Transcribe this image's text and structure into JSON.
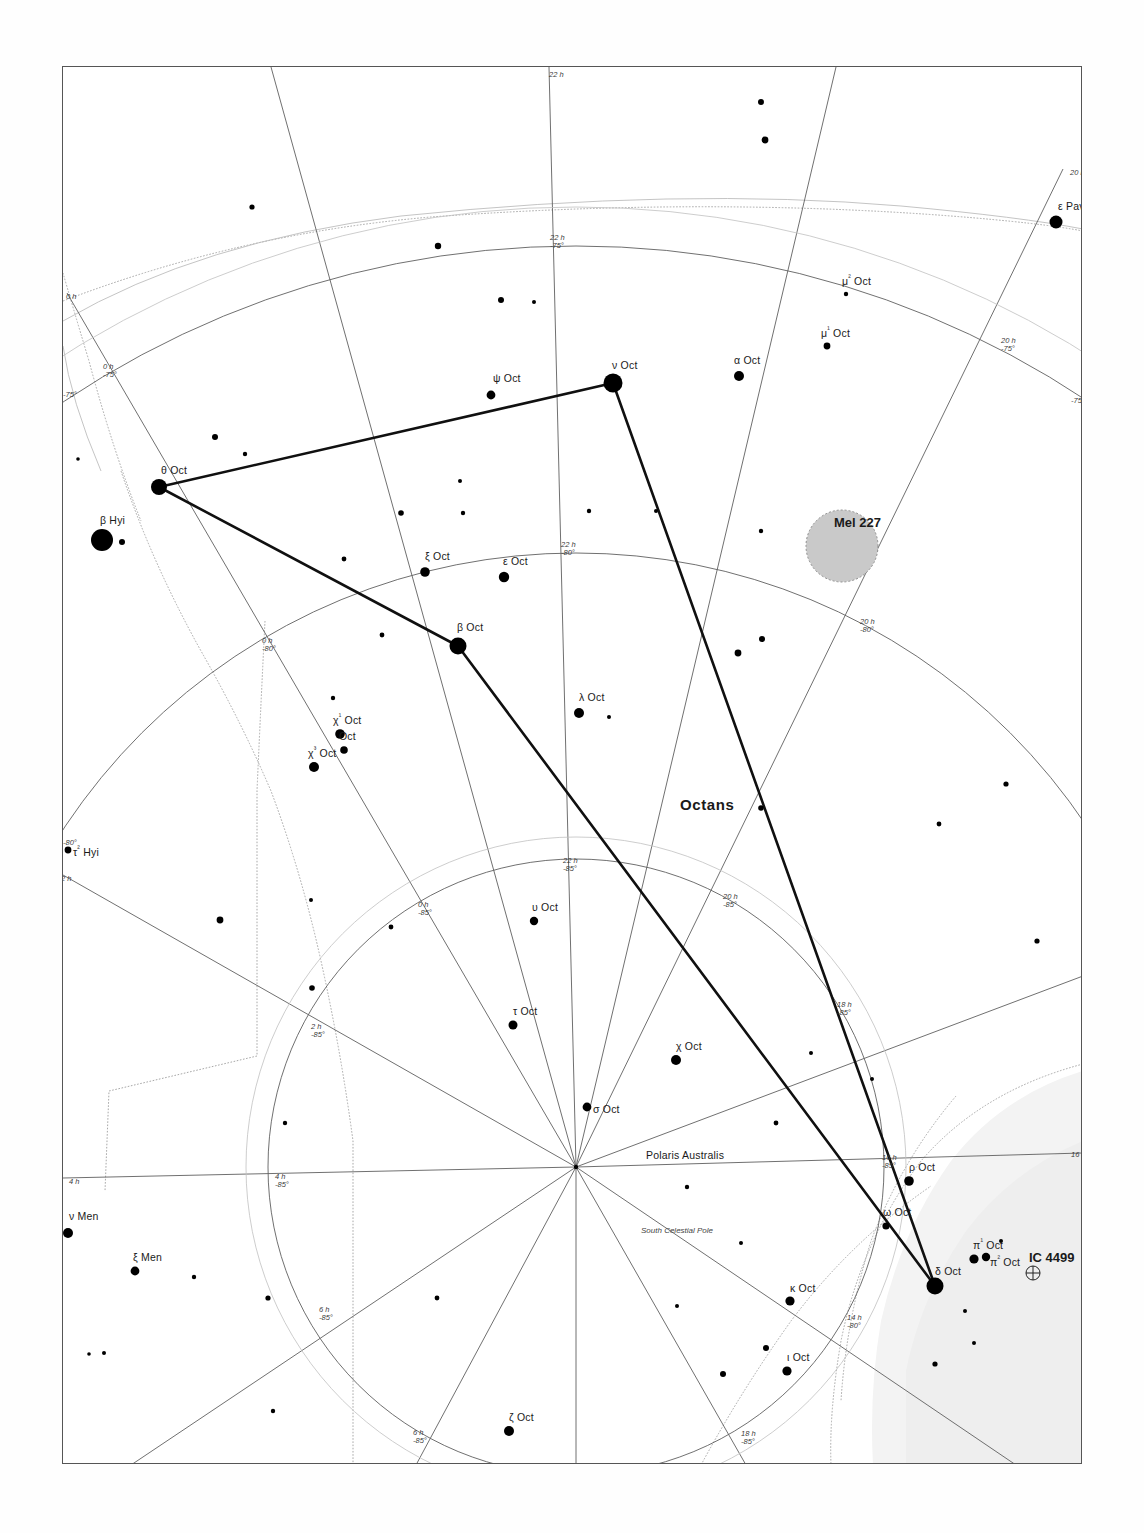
{
  "chart_title": "Octans star chart",
  "constellation": {
    "name": "Octans",
    "x": 617,
    "y": 737
  },
  "pole": {
    "label": "South Celestial Pole",
    "x": 575,
    "y": 1166
  },
  "stars": [
    {
      "name": "ε Pav",
      "label": "ε Pav",
      "x": 1055,
      "y": 221,
      "mag": 4.0,
      "r": 6.5,
      "lx": 1057,
      "ly": 199
    },
    {
      "name": "μ² Oct",
      "label": "μ² Oct",
      "x": 845,
      "y": 293,
      "mag": 6.5,
      "r": 2.2,
      "lx": 841,
      "ly": 272
    },
    {
      "name": "μ¹ Oct",
      "label": "μ¹ Oct",
      "x": 826,
      "y": 345,
      "mag": 6.0,
      "r": 3.4,
      "lx": 820,
      "ly": 324
    },
    {
      "name": "α Oct",
      "label": "α Oct",
      "x": 738,
      "y": 375,
      "mag": 5.1,
      "r": 5.0,
      "lx": 733,
      "ly": 353
    },
    {
      "name": "ν Oct",
      "label": "ν Oct",
      "x": 612,
      "y": 382,
      "mag": 3.7,
      "r": 9.5,
      "lx": 611,
      "ly": 358
    },
    {
      "name": "ψ Oct",
      "label": "ψ Oct",
      "x": 490,
      "y": 394,
      "mag": 5.5,
      "r": 4.4,
      "lx": 492,
      "ly": 371
    },
    {
      "name": "θ Oct",
      "label": "θ Oct",
      "x": 158,
      "y": 486,
      "mag": 4.7,
      "r": 8.0,
      "lx": 160,
      "ly": 463
    },
    {
      "name": "β Hyi",
      "label": "β Hyi",
      "x": 101,
      "y": 539,
      "mag": 2.8,
      "r": 11.0,
      "lx": 99,
      "ly": 513
    },
    {
      "name": "HIP-b",
      "label": "",
      "x": 121,
      "y": 541,
      "mag": 6.2,
      "r": 3.0,
      "lx": 0,
      "ly": 0
    },
    {
      "name": "ξ Oct",
      "label": "ξ Oct",
      "x": 424,
      "y": 571,
      "mag": 5.3,
      "r": 4.8,
      "lx": 424,
      "ly": 549
    },
    {
      "name": "ε Oct",
      "label": "ε Oct",
      "x": 503,
      "y": 576,
      "mag": 5.1,
      "r": 5.2,
      "lx": 502,
      "ly": 554
    },
    {
      "name": "β Oct",
      "label": "β Oct",
      "x": 457,
      "y": 645,
      "mag": 4.1,
      "r": 8.5,
      "lx": 456,
      "ly": 620
    },
    {
      "name": "λ Oct",
      "label": "λ Oct",
      "x": 578,
      "y": 712,
      "mag": 5.3,
      "r": 5.0,
      "lx": 578,
      "ly": 690
    },
    {
      "name": "χ¹ Oct",
      "label": "χ¹ Oct",
      "x": 339,
      "y": 733,
      "mag": 5.3,
      "r": 4.8,
      "lx": 332,
      "ly": 711
    },
    {
      "name": "χ² Oct",
      "label": "Oct",
      "x": 343,
      "y": 749,
      "mag": 5.7,
      "r": 3.8,
      "lx": 338,
      "ly": 729
    },
    {
      "name": "χ³ Oct",
      "label": "χ³ Oct",
      "x": 313,
      "y": 766,
      "mag": 5.3,
      "r": 5.0,
      "lx": 307,
      "ly": 744
    },
    {
      "name": "τ² Hyi",
      "label": "τ² Hyi",
      "x": 67,
      "y": 849,
      "mag": 6.0,
      "r": 3.4,
      "lx": 72,
      "ly": 843
    },
    {
      "name": "υ Oct",
      "label": "υ Oct",
      "x": 533,
      "y": 920,
      "mag": 5.7,
      "r": 4.2,
      "lx": 531,
      "ly": 900
    },
    {
      "name": "τ Oct",
      "label": "τ Oct",
      "x": 512,
      "y": 1024,
      "mag": 5.5,
      "r": 4.5,
      "lx": 512,
      "ly": 1004
    },
    {
      "name": "χ Oct",
      "label": "χ Oct",
      "x": 675,
      "y": 1059,
      "mag": 5.3,
      "r": 5.0,
      "lx": 675,
      "ly": 1039
    },
    {
      "name": "σ Oct",
      "label": "σ Oct",
      "x": 586,
      "y": 1106,
      "mag": 5.4,
      "r": 4.4,
      "lx": 592,
      "ly": 1102
    },
    {
      "name": "ν Men",
      "label": "ν Men",
      "x": 67,
      "y": 1232,
      "mag": 5.8,
      "r": 5.0,
      "lx": 68,
      "ly": 1209
    },
    {
      "name": "ρ Oct",
      "label": "ρ Oct",
      "x": 908,
      "y": 1180,
      "mag": 5.6,
      "r": 4.8,
      "lx": 908,
      "ly": 1160
    },
    {
      "name": "ω Oct",
      "label": "ω Oct",
      "x": 885,
      "y": 1225,
      "mag": 5.9,
      "r": 3.6,
      "lx": 882,
      "ly": 1205
    },
    {
      "name": "π¹ Oct",
      "label": "π¹ Oct",
      "x": 973,
      "y": 1258,
      "mag": 5.6,
      "r": 4.6,
      "lx": 972,
      "ly": 1236
    },
    {
      "name": "π² Oct",
      "label": "π² Oct",
      "x": 985,
      "y": 1256,
      "mag": 5.7,
      "r": 4.2,
      "lx": 989,
      "ly": 1253
    },
    {
      "name": "ξ Men",
      "label": "ξ Men",
      "x": 134,
      "y": 1270,
      "mag": 5.8,
      "r": 4.4,
      "lx": 132,
      "ly": 1250
    },
    {
      "name": "δ Oct",
      "label": "δ Oct",
      "x": 934,
      "y": 1285,
      "mag": 4.3,
      "r": 8.5,
      "lx": 934,
      "ly": 1264
    },
    {
      "name": "κ Oct",
      "label": "κ Oct",
      "x": 789,
      "y": 1300,
      "mag": 5.6,
      "r": 4.6,
      "lx": 789,
      "ly": 1281
    },
    {
      "name": "ι Oct",
      "label": "ι Oct",
      "x": 786,
      "y": 1370,
      "mag": 5.5,
      "r": 4.6,
      "lx": 786,
      "ly": 1350
    },
    {
      "name": "η Aps",
      "label": "η A",
      "x": 1102,
      "y": 1392,
      "mag": 4.9,
      "r": 6.0,
      "lx": 1096,
      "ly": 1370
    },
    {
      "name": "ζ Oct",
      "label": "ζ Oct",
      "x": 508,
      "y": 1430,
      "mag": 5.4,
      "r": 5.0,
      "lx": 508,
      "ly": 1410
    }
  ],
  "field_stars": [
    {
      "x": 760,
      "y": 101,
      "r": 3.0
    },
    {
      "x": 764,
      "y": 139,
      "r": 3.4
    },
    {
      "x": 251,
      "y": 206,
      "r": 2.6
    },
    {
      "x": 437,
      "y": 245,
      "r": 3.2
    },
    {
      "x": 533,
      "y": 301,
      "r": 2.0
    },
    {
      "x": 500,
      "y": 299,
      "r": 3.0
    },
    {
      "x": 214,
      "y": 436,
      "r": 3.0
    },
    {
      "x": 244,
      "y": 453,
      "r": 2.2
    },
    {
      "x": 77,
      "y": 458,
      "r": 1.8
    },
    {
      "x": 343,
      "y": 558,
      "r": 2.4
    },
    {
      "x": 400,
      "y": 512,
      "r": 2.8
    },
    {
      "x": 459,
      "y": 480,
      "r": 2.0
    },
    {
      "x": 462,
      "y": 512,
      "r": 2.2
    },
    {
      "x": 588,
      "y": 510,
      "r": 2.2
    },
    {
      "x": 655,
      "y": 510,
      "r": 2.0
    },
    {
      "x": 760,
      "y": 530,
      "r": 2.2
    },
    {
      "x": 737,
      "y": 652,
      "r": 3.4
    },
    {
      "x": 761,
      "y": 638,
      "r": 3.0
    },
    {
      "x": 381,
      "y": 634,
      "r": 2.4
    },
    {
      "x": 332,
      "y": 697,
      "r": 2.2
    },
    {
      "x": 608,
      "y": 716,
      "r": 2.0
    },
    {
      "x": 760,
      "y": 807,
      "r": 2.8
    },
    {
      "x": 938,
      "y": 823,
      "r": 2.4
    },
    {
      "x": 1005,
      "y": 783,
      "r": 2.6
    },
    {
      "x": 1036,
      "y": 940,
      "r": 2.6
    },
    {
      "x": 219,
      "y": 919,
      "r": 3.4
    },
    {
      "x": 310,
      "y": 899,
      "r": 2.0
    },
    {
      "x": 390,
      "y": 926,
      "r": 2.4
    },
    {
      "x": 311,
      "y": 987,
      "r": 2.8
    },
    {
      "x": 810,
      "y": 1052,
      "r": 2.0
    },
    {
      "x": 775,
      "y": 1122,
      "r": 2.4
    },
    {
      "x": 686,
      "y": 1186,
      "r": 2.2
    },
    {
      "x": 284,
      "y": 1122,
      "r": 2.2
    },
    {
      "x": 103,
      "y": 1352,
      "r": 2.0
    },
    {
      "x": 88,
      "y": 1353,
      "r": 1.8
    },
    {
      "x": 267,
      "y": 1297,
      "r": 2.6
    },
    {
      "x": 436,
      "y": 1297,
      "r": 2.4
    },
    {
      "x": 272,
      "y": 1410,
      "r": 2.2
    },
    {
      "x": 722,
      "y": 1373,
      "r": 3.0
    },
    {
      "x": 765,
      "y": 1347,
      "r": 3.0
    },
    {
      "x": 934,
      "y": 1363,
      "r": 2.6
    },
    {
      "x": 964,
      "y": 1310,
      "r": 2.0
    },
    {
      "x": 973,
      "y": 1342,
      "r": 2.0
    },
    {
      "x": 1000,
      "y": 1240,
      "r": 2.0
    },
    {
      "x": 871,
      "y": 1078,
      "r": 2.0
    },
    {
      "x": 676,
      "y": 1305,
      "r": 2.0
    },
    {
      "x": 740,
      "y": 1242,
      "r": 2.0
    },
    {
      "x": 193,
      "y": 1276,
      "r": 2.2
    }
  ],
  "deep_sky": [
    {
      "name": "Mel 227",
      "label": "Mel 227",
      "type": "open-cluster",
      "x": 841,
      "y": 545,
      "r": 36,
      "lx": 833,
      "ly": 514
    },
    {
      "name": "IC 4499",
      "label": "IC 4499",
      "type": "globular-cluster",
      "x": 1032,
      "y": 1272,
      "r": 7,
      "lx": 1028,
      "ly": 1249
    }
  ],
  "constellation_lines": [
    {
      "from": "θ Oct",
      "to": "ν Oct"
    },
    {
      "from": "ν Oct",
      "to": "δ Oct"
    },
    {
      "from": "θ Oct",
      "to": "β Oct"
    },
    {
      "from": "β Oct",
      "to": "δ Oct"
    }
  ],
  "grid_labels": [
    {
      "text": "22 h",
      "x": 548,
      "y": 70,
      "lines": [
        "22 h"
      ]
    },
    {
      "text": "20 h",
      "x": 1069,
      "y": 168,
      "lines": [
        "20 h"
      ]
    },
    {
      "text": "0 h",
      "x": 65,
      "y": 292,
      "lines": [
        "0 h"
      ]
    },
    {
      "text": "22 h / -75°",
      "x": 549,
      "y": 233,
      "lines": [
        "22 h",
        "-75°"
      ]
    },
    {
      "text": "0 h / -75°",
      "x": 102,
      "y": 362,
      "lines": [
        "0 h",
        "-75°"
      ]
    },
    {
      "text": "-75°",
      "x": 62,
      "y": 390,
      "lines": [
        "-75°"
      ]
    },
    {
      "text": "20 h / -75°",
      "x": 1000,
      "y": 336,
      "lines": [
        "20 h",
        "-75°"
      ]
    },
    {
      "text": "-75°",
      "x": 1070,
      "y": 396,
      "lines": [
        "-75°"
      ]
    },
    {
      "text": "22 h / -80°",
      "x": 560,
      "y": 540,
      "lines": [
        "22 h",
        "-80°"
      ]
    },
    {
      "text": "0 h / -80°",
      "x": 261,
      "y": 636,
      "lines": [
        "0 h",
        "-80°"
      ]
    },
    {
      "text": "20 h / -80°",
      "x": 859,
      "y": 617,
      "lines": [
        "20 h",
        "-80°"
      ]
    },
    {
      "text": "-80°",
      "x": 62,
      "y": 838,
      "lines": [
        "-80°"
      ]
    },
    {
      "text": "2 h",
      "x": 60,
      "y": 874,
      "lines": [
        "2 h"
      ]
    },
    {
      "text": "22 h / -85°",
      "x": 562,
      "y": 856,
      "lines": [
        "22 h",
        "-85°"
      ]
    },
    {
      "text": "0 h / -85°",
      "x": 417,
      "y": 900,
      "lines": [
        "0 h",
        "-85°"
      ]
    },
    {
      "text": "20 h / -85°",
      "x": 722,
      "y": 892,
      "lines": [
        "20 h",
        "-85°"
      ]
    },
    {
      "text": "18 h / -85°",
      "x": 836,
      "y": 1000,
      "lines": [
        "18 h",
        "-85°"
      ]
    },
    {
      "text": "2 h / -85°",
      "x": 310,
      "y": 1022,
      "lines": [
        "2 h",
        "-85°"
      ]
    },
    {
      "text": "16 h / -85°",
      "x": 881,
      "y": 1153,
      "lines": [
        "16 h",
        "-85°"
      ]
    },
    {
      "text": "16 h",
      "x": 1070,
      "y": 1150,
      "lines": [
        "16 h"
      ]
    },
    {
      "text": "4 h",
      "x": 68,
      "y": 1177,
      "lines": [
        "4 h"
      ]
    },
    {
      "text": "4 h / -85°",
      "x": 274,
      "y": 1172,
      "lines": [
        "4 h",
        "-85°"
      ]
    },
    {
      "text": "14 h / -80°",
      "x": 846,
      "y": 1313,
      "lines": [
        "14 h",
        "-80°"
      ]
    },
    {
      "text": "6 h / -85°",
      "x": 318,
      "y": 1305,
      "lines": [
        "6 h",
        "-85°"
      ]
    },
    {
      "text": "6 h / -85°",
      "x": 412,
      "y": 1428,
      "lines": [
        "6 h",
        "-85°"
      ]
    },
    {
      "text": "18 h / -85°",
      "x": 740,
      "y": 1429,
      "lines": [
        "18 h",
        "-85°"
      ]
    },
    {
      "text": "12 h",
      "x": 1100,
      "y": 1452,
      "lines": [
        "12 h"
      ]
    }
  ],
  "colors": {
    "star": "#000000",
    "grid": "#6a6a6a",
    "boundary": "#9a9a9a",
    "constellation_line": "#111111",
    "ecliptic": "#b6b6b6",
    "mel227_fill": "#c9c9c9",
    "milky_way": "#f2f2f2",
    "frame": "#555555",
    "background": "#ffffff"
  }
}
